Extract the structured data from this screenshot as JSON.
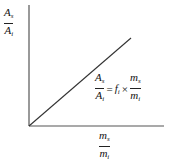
{
  "diagram": {
    "y_axis_label": {
      "num": "A",
      "num_sub": "s",
      "den": "A",
      "den_sub": "i"
    },
    "x_axis_label": {
      "num": "m",
      "num_sub": "s",
      "den": "m",
      "den_sub": "i"
    },
    "equation": {
      "lhs": {
        "num": "A",
        "num_sub": "s",
        "den": "A",
        "den_sub": "i"
      },
      "equals": "=",
      "factor": "f",
      "factor_sub": "i",
      "times": "×",
      "rhs": {
        "num": "m",
        "num_sub": "s",
        "den": "m",
        "den_sub": "i"
      }
    },
    "colors": {
      "axis": "#555555",
      "line": "#333333"
    }
  }
}
